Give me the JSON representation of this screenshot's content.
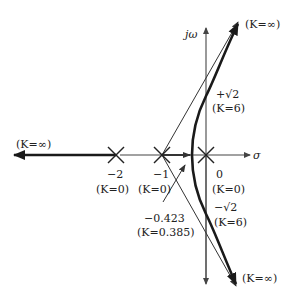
{
  "diagram": {
    "type": "root-locus",
    "axes": {
      "real_axis_label": "σ",
      "imag_axis_label": "jω"
    },
    "poles": [
      {
        "value": "−2",
        "gain": "(K=0)"
      },
      {
        "value": "−1",
        "gain": "(K=0)"
      },
      {
        "value": "0",
        "gain": "(K=0)"
      }
    ],
    "crossings": {
      "upper": {
        "value": "+√2",
        "gain": "(K=6)"
      },
      "lower": {
        "value": "−√2",
        "gain": "(K=6)"
      }
    },
    "breakaway": {
      "value": "−0.423",
      "gain": "(K=0.385)"
    },
    "asymptote_labels": {
      "left": "(K=∞)",
      "upper_right": "(K=∞)",
      "lower_right": "(K=∞)"
    },
    "colors": {
      "locus": "#1a1a1a",
      "axis": "#444444",
      "text": "#222222"
    }
  }
}
